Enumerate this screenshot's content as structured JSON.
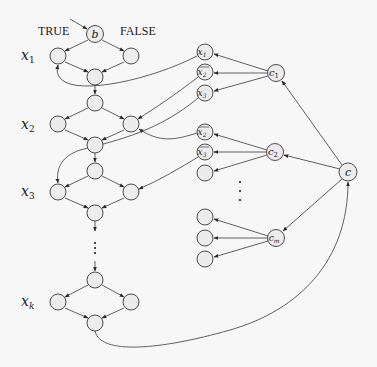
{
  "labels": {
    "true": "TRUE",
    "false": "FALSE",
    "b": "b",
    "c": "c",
    "c1": "c",
    "c1_sub": "1",
    "c2": "c",
    "c2_sub": "2",
    "cm": "c",
    "cm_sub": "m",
    "var_x1": "x",
    "var_x1_sub": "1",
    "var_x2": "x",
    "var_x2_sub": "2",
    "var_x3": "x",
    "var_x3_sub": "3",
    "var_xk": "x",
    "var_xk_sub": "k",
    "lit_x1": "x",
    "lit_x1_sub": "1",
    "lit_nx2": "x",
    "lit_nx2_sub": "2",
    "lit_x3": "x",
    "lit_x3_sub": "3",
    "lit2_nx2": "x",
    "lit2_nx2_sub": "2",
    "lit2_nx3": "x",
    "lit2_nx3_sub": "3"
  },
  "colors": {
    "node_fill": "#ececec",
    "stroke": "#3a3a3a",
    "background": "#f7f7f7"
  }
}
